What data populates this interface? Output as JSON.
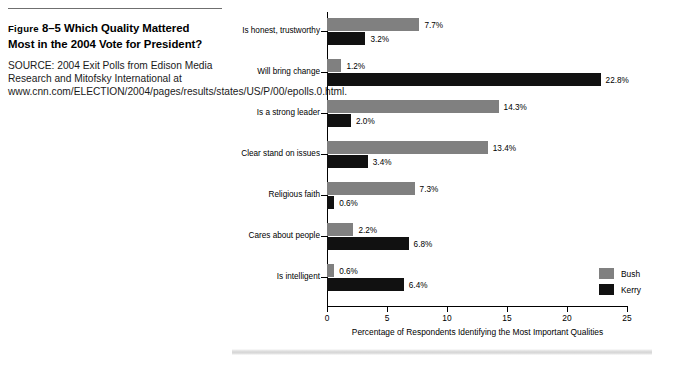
{
  "caption": {
    "figure_label": "Figure",
    "figure_number": "8–5",
    "title_line1": "Which Quality Mattered",
    "title_line2": "Most in the 2004 Vote for President?",
    "source": "SOURCE: 2004 Exit Polls from Edison Media Research and Mitofsky International at www.cnn.com/ELECTION/2004/pages/results/states/US/P/00/epolls.0.html."
  },
  "chart_data": {
    "type": "bar",
    "orientation": "horizontal",
    "title": "Which Quality Mattered Most in the 2004 Vote for President?",
    "xlabel": "Percentage of Respondents Identifying the Most Important Qualities",
    "ylabel": "",
    "xlim": [
      0,
      25
    ],
    "xticks": [
      "0",
      "5",
      "10",
      "15",
      "20",
      "25"
    ],
    "grid": false,
    "legend_position": "bottom-right",
    "categories": [
      "Is honest, trustworthy",
      "Will bring change",
      "Is a strong leader",
      "Clear stand on issues",
      "Religious faith",
      "Cares about people",
      "Is intelligent"
    ],
    "series": [
      {
        "name": "Bush",
        "color": "#808080",
        "values": [
          7.7,
          1.2,
          14.3,
          13.4,
          7.3,
          2.2,
          0.6
        ],
        "labels": [
          "7.7%",
          "1.2%",
          "14.3%",
          "13.4%",
          "7.3%",
          "2.2%",
          "0.6%"
        ]
      },
      {
        "name": "Kerry",
        "color": "#111111",
        "values": [
          3.2,
          22.8,
          2.0,
          3.4,
          0.6,
          6.8,
          6.4
        ],
        "labels": [
          "3.2%",
          "22.8%",
          "2.0%",
          "3.4%",
          "0.6%",
          "6.8%",
          "6.4%"
        ]
      }
    ]
  }
}
